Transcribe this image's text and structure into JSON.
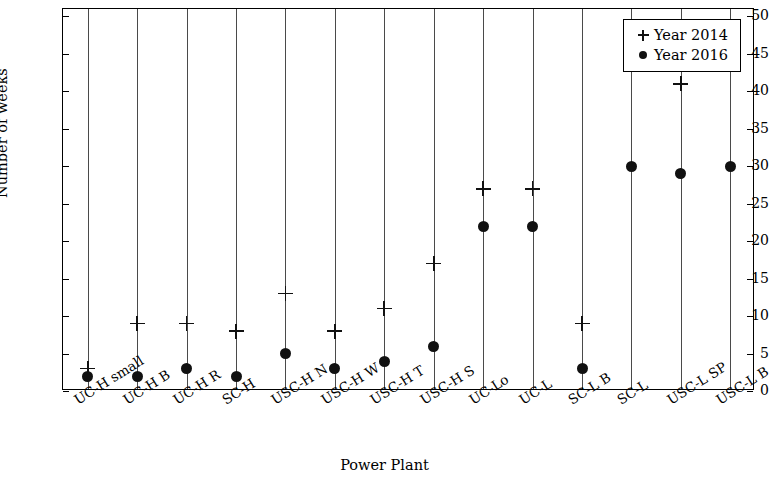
{
  "chart_data": {
    "type": "scatter",
    "title": "",
    "xlabel": "Power Plant",
    "ylabel": "Number of weeks",
    "ylim": [
      0,
      51
    ],
    "yticks": [
      0,
      5,
      10,
      15,
      20,
      25,
      30,
      35,
      40,
      45,
      50
    ],
    "grid": "vertical",
    "legend_position": "top-right",
    "categories": [
      "UC-H small",
      "UC-H B",
      "UC-H R",
      "SC-H",
      "USC-H N",
      "USC-H W",
      "USC-H T",
      "USC-H S",
      "UC-Lo",
      "UC-L",
      "SC-L B",
      "SC-L",
      "USC-L SP",
      "USC-L B"
    ],
    "series": [
      {
        "name": "Year 2014",
        "marker": "plus",
        "color": "#111111",
        "values": [
          3,
          9,
          9,
          8,
          13,
          8,
          11,
          17,
          27,
          27,
          9,
          44,
          41,
          null
        ]
      },
      {
        "name": "Year 2016",
        "marker": "dot",
        "color": "#111111",
        "values": [
          2,
          2,
          3,
          2,
          5,
          3,
          4,
          6,
          22,
          22,
          3,
          30,
          29,
          30
        ]
      }
    ]
  },
  "legend": {
    "items": [
      {
        "label": "Year 2014",
        "marker": "plus"
      },
      {
        "label": "Year 2016",
        "marker": "dot"
      }
    ]
  }
}
